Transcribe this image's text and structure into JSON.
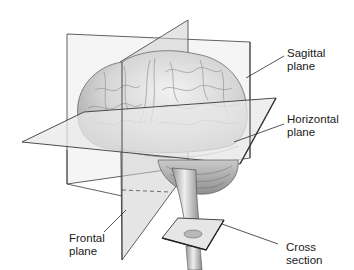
{
  "diagram": {
    "labels": {
      "sagittal": "Sagittal\nplane",
      "horizontal": "Horizontal\nplane",
      "frontal": "Frontal\nplane",
      "cross": "Cross\nsection"
    },
    "colors": {
      "background": "#ffffff",
      "plane_fill": "#d9d9d9",
      "plane_edge": "#3a3a3a",
      "brain_fill": "#e4e4e4",
      "brain_shade": "#bdbdbd",
      "text": "#1a1a1a",
      "leader_line": "#2a2a2a"
    }
  }
}
